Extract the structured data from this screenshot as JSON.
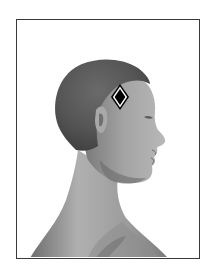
{
  "image": {
    "description": "Grayscale rendering of a bald human head and shoulders in right-facing profile inside a thin rectangular frame, with a diamond marker placed on the temple",
    "subject": "head-profile",
    "orientation": "facing-right",
    "colors": {
      "background": "#ffffff",
      "frame_border": "#3a3a3a",
      "hair_dark": "#5a5a5a",
      "skin_mid": "#8e8e8e",
      "skin_light": "#b4b4b4",
      "marker_fill": "#000000",
      "marker_outline": "#ffffff"
    }
  },
  "marker": {
    "shape": "diamond",
    "icon": "diamond-marker-icon",
    "location": "temple",
    "center_x": 120,
    "center_y": 97
  }
}
